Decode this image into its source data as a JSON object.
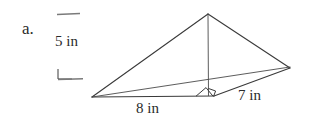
{
  "figure": {
    "item_label": "a.",
    "height_label": "5 in",
    "base_label": "8 in",
    "side_label": "7 in",
    "background_color": "#ffffff",
    "line_color": "#3a3a3a",
    "text_color": "#2b2b2b"
  },
  "icons": {
    "height_tick": "horizontal-rule-icon",
    "right_angle": "right-angle-mark-icon"
  },
  "geometry": {
    "type": "pyramid-net-diagram",
    "apex": {
      "x": 208,
      "y": 14
    },
    "left_vertex": {
      "x": 92,
      "y": 97
    },
    "right_vertex": {
      "x": 290,
      "y": 68
    },
    "base_front_vertex": {
      "x": 213,
      "y": 96
    },
    "height_foot": {
      "x": 208,
      "y": 95
    },
    "dimensions": {
      "height_in": 5,
      "base_in": 8,
      "side_in": 7
    }
  }
}
